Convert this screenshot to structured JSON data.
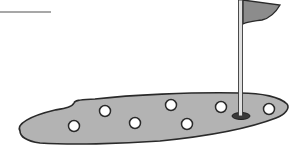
{
  "illustration": {
    "subject": "putting green with golf balls and flag",
    "colors": {
      "green_fill": "#b3b3b3",
      "outline": "#2a2a2a",
      "flag_fill": "#8c8c8c",
      "pole_fill": "#e0e0e0",
      "ball_fill": "#ffffff",
      "background": "#ffffff",
      "horizon_line": "#8a8a8a"
    },
    "balls": [
      {
        "cx": 74,
        "cy": 126
      },
      {
        "cx": 105,
        "cy": 111
      },
      {
        "cx": 135,
        "cy": 123
      },
      {
        "cx": 171,
        "cy": 105
      },
      {
        "cx": 187,
        "cy": 124
      },
      {
        "cx": 221,
        "cy": 107
      },
      {
        "cx": 269,
        "cy": 109
      }
    ],
    "hole": {
      "cx": 241,
      "cy": 116
    },
    "pole": {
      "x": 240,
      "top": 0,
      "bottom": 115
    }
  }
}
